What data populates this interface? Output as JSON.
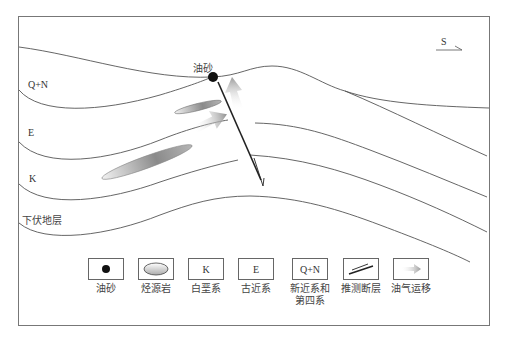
{
  "diagram": {
    "type": "geological cross-section",
    "direction_label": "S",
    "oil_sand_label": "油砂",
    "strata_labels": [
      {
        "id": "qn",
        "label": "Q+N"
      },
      {
        "id": "e",
        "label": "E"
      },
      {
        "id": "k",
        "label": "K"
      },
      {
        "id": "underlying",
        "label": "下伏地层"
      }
    ]
  },
  "legend": {
    "items": [
      {
        "symbol": "oil-sand-dot",
        "box_text": "",
        "label": "油砂",
        "label2": ""
      },
      {
        "symbol": "source-rock-ellipse",
        "box_text": "",
        "label": "烃源岩",
        "label2": ""
      },
      {
        "symbol": "text",
        "box_text": "K",
        "label": "白垩系",
        "label2": ""
      },
      {
        "symbol": "text",
        "box_text": "E",
        "label": "古近系",
        "label2": ""
      },
      {
        "symbol": "text",
        "box_text": "Q+N",
        "label": "新近系和",
        "label2": "第四系"
      },
      {
        "symbol": "inferred-fault",
        "box_text": "",
        "label": "推测断层",
        "label2": ""
      },
      {
        "symbol": "migration-arrow",
        "box_text": "",
        "label": "油气运移",
        "label2": ""
      }
    ]
  },
  "colors": {
    "line": "#555555",
    "fault": "#222222",
    "frame": "#777777",
    "source_rock": "#888888",
    "migration": "#999999"
  }
}
